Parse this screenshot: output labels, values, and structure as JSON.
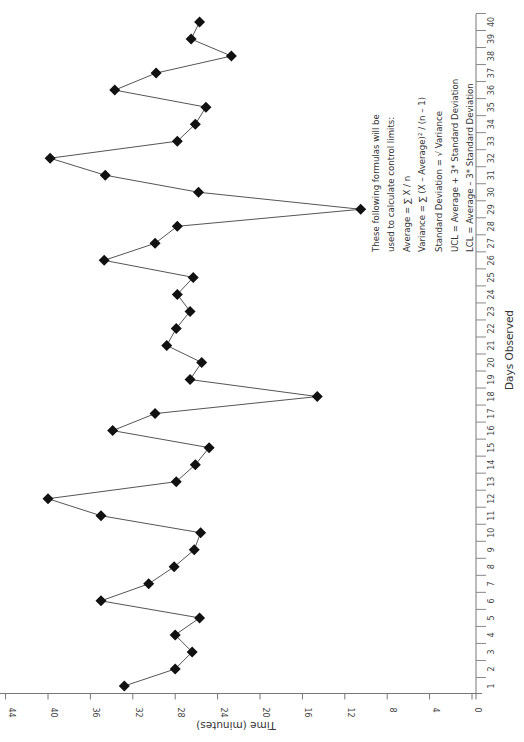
{
  "chart_data": {
    "type": "line",
    "orientation": "rotated-90-ccw",
    "title": "",
    "xlabel": "Days Observed",
    "ylabel": "Time (minutes)",
    "x": [
      1,
      2,
      3,
      4,
      5,
      6,
      7,
      8,
      9,
      10,
      11,
      12,
      13,
      14,
      15,
      16,
      17,
      18,
      19,
      20,
      21,
      22,
      23,
      24,
      25,
      26,
      27,
      28,
      29,
      30,
      31,
      32,
      33,
      34,
      35,
      36,
      37,
      38,
      39,
      40
    ],
    "series": [
      {
        "name": "Time (minutes)",
        "marker": "diamond",
        "color": "#111111",
        "line_color": "#555555",
        "values": [
          32.8,
          28.0,
          26.4,
          28.0,
          25.7,
          35.0,
          30.5,
          28.1,
          26.2,
          25.6,
          35.0,
          40.0,
          27.9,
          26.1,
          24.8,
          33.9,
          29.9,
          14.6,
          26.6,
          25.5,
          28.8,
          27.9,
          26.6,
          27.8,
          26.3,
          34.7,
          29.9,
          27.8,
          10.5,
          25.8,
          34.6,
          39.8,
          27.8,
          26.1,
          25.1,
          33.7,
          29.8,
          22.7,
          26.5,
          25.7
        ]
      }
    ],
    "x_ticks": [
      "1",
      "2",
      "3",
      "4",
      "5",
      "6",
      "7",
      "8",
      "9",
      "10",
      "11",
      "12",
      "13",
      "14",
      "15",
      "16",
      "17",
      "18",
      "19",
      "20",
      "21",
      "22",
      "23",
      "24",
      "25",
      "26",
      "27",
      "28",
      "29",
      "30",
      "31",
      "32",
      "33",
      "34",
      "35",
      "36",
      "37",
      "38",
      "39",
      "40"
    ],
    "y_ticks": [
      "0",
      "4",
      "8",
      "12",
      "16",
      "20",
      "24",
      "28",
      "32",
      "36",
      "40",
      "44"
    ],
    "ylim": [
      0,
      44
    ],
    "xlim": [
      1,
      40
    ],
    "grid": false,
    "legend": null,
    "annotation": [
      "These following formulas will be",
      "used to calculate control limits:",
      "Average = ∑ X / n",
      "Variance = ∑ (X – Average)² / (n – 1)",
      "Standard Deviation = √ Variance",
      "UCL = Average + 3* Standard Deviation",
      "LCL = Average – 3* Standard Deviation"
    ]
  }
}
